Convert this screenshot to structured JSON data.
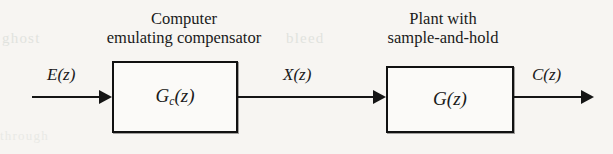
{
  "diagram": {
    "type": "block-diagram",
    "blocks": [
      {
        "id": "compensator",
        "transfer_function": "G",
        "subscript": "c",
        "argument": "(z)",
        "caption_line1": "Computer",
        "caption_line2": "emulating compensator"
      },
      {
        "id": "plant",
        "transfer_function": "G",
        "subscript": "",
        "argument": "(z)",
        "caption_line1": "Plant with",
        "caption_line2": "sample-and-hold"
      }
    ],
    "signals": {
      "input": "E(z)",
      "intermediate": "X(z)",
      "output": "C(z)"
    },
    "ghost_text": {
      "left": "ghost",
      "right": "bleed",
      "bottom": "through"
    },
    "colors": {
      "page_background": "#f7f5f2",
      "ink": "#151515",
      "block_fill": "#fbfaf8"
    }
  }
}
